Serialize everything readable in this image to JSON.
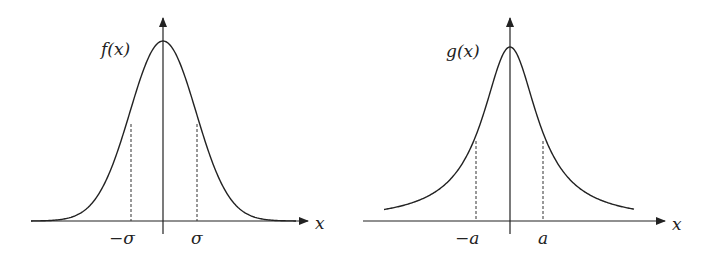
{
  "chart_data": [
    {
      "type": "line",
      "title": "",
      "curve": "gaussian",
      "ylabel": "f(x)",
      "xlabel": "x",
      "tick_labels": [
        "−σ",
        "σ"
      ],
      "annotations": [
        "dashed verticals at x = −σ and x = σ"
      ],
      "x": [
        -4,
        -3,
        -2,
        -1,
        0,
        1,
        2,
        3,
        4
      ],
      "values": [
        0.0003,
        0.011,
        0.135,
        0.607,
        1.0,
        0.607,
        0.135,
        0.011,
        0.0003
      ],
      "grid": false
    },
    {
      "type": "line",
      "title": "",
      "curve": "lorentzian",
      "ylabel": "g(x)",
      "xlabel": "x",
      "tick_labels": [
        "−a",
        "a"
      ],
      "annotations": [
        "dashed verticals at x = −a and x = a"
      ],
      "x": [
        -4,
        -3,
        -2,
        -1,
        0,
        1,
        2,
        3,
        4
      ],
      "values": [
        0.059,
        0.1,
        0.2,
        0.5,
        1.0,
        0.5,
        0.2,
        0.1,
        0.059
      ],
      "grid": false
    }
  ],
  "left": {
    "ylabel": "f(x)",
    "xlabel": "x",
    "neg_tick": "−σ",
    "pos_tick": "σ"
  },
  "right": {
    "ylabel": "g(x)",
    "xlabel": "x",
    "neg_tick": "−a",
    "pos_tick": "a"
  }
}
